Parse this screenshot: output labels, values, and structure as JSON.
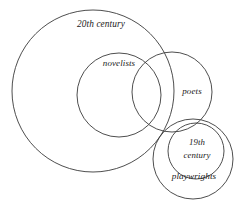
{
  "diagram": {
    "type": "euler-venn-diagram",
    "background_color": "#ffffff",
    "stroke_color": "#3a3a3a",
    "text_color": "#1a1a1a",
    "width": 238,
    "height": 200,
    "sets": [
      {
        "id": "twentieth-century",
        "label": "20th century",
        "label_x": 101,
        "label_y": 25,
        "cx": 93,
        "cy": 91,
        "r": 81
      },
      {
        "id": "novelists",
        "label": "novelists",
        "label_x": 119,
        "label_y": 64,
        "cx": 119,
        "cy": 95,
        "r": 42
      },
      {
        "id": "poets",
        "label": "poets",
        "label_x": 192,
        "label_y": 92,
        "cx": 172,
        "cy": 92,
        "r": 40
      },
      {
        "id": "playwrights",
        "label": "playwrights",
        "label_x": 194,
        "label_y": 177,
        "cx": 193,
        "cy": 159,
        "r": 40
      },
      {
        "id": "nineteenth-century",
        "label_line1": "19th",
        "label_line2": "century",
        "label_x": 197,
        "label_y_line1": 143,
        "label_y_line2": 156,
        "cx": 196,
        "cy": 151,
        "r": 28
      }
    ]
  }
}
